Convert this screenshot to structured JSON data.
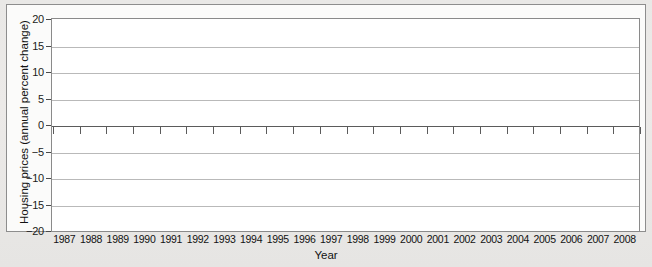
{
  "chart_data": {
    "type": "bar",
    "title": "",
    "xlabel": "Year",
    "ylabel": "Housing prices (annual percent change)",
    "categories": [
      "1987",
      "1988",
      "1989",
      "1990",
      "1991",
      "1992",
      "1993",
      "1994",
      "1995",
      "1996",
      "1997",
      "1998",
      "1999",
      "2000",
      "2001",
      "2002",
      "2003",
      "2004",
      "2005",
      "2006",
      "2007",
      "2008"
    ],
    "values": [
      7.5,
      8.5,
      4.3,
      -2.8,
      0.9,
      0.2,
      2.5,
      1.4,
      2.2,
      2.4,
      4.6,
      7.2,
      8.2,
      9.0,
      7.5,
      10.2,
      11.8,
      15.3,
      11.2,
      -2.0,
      -19.0,
      -12.0
    ],
    "ylim": [
      -20,
      20
    ],
    "yticks": [
      20,
      15,
      10,
      5,
      0,
      -5,
      -10,
      -15,
      -20
    ],
    "ytick_labels": [
      "20",
      "15",
      "10",
      "5",
      "0",
      "−5",
      "−10",
      "−15",
      "−20"
    ],
    "grid": true,
    "legend": "none",
    "bar_color": "#6f6f6f",
    "gridline_color": "#b9b9b9",
    "axis_color": "#5b5b5b",
    "background_color": "#ffffff",
    "page_color": "#e8e7e5"
  }
}
